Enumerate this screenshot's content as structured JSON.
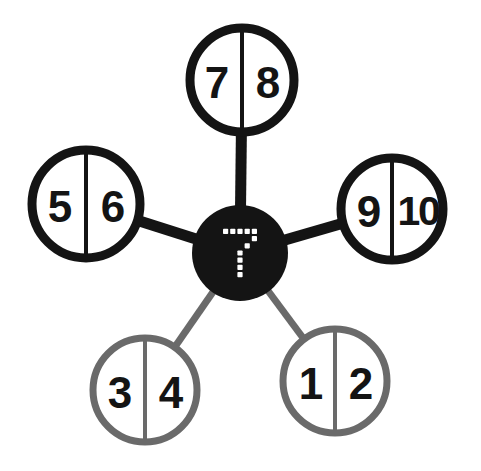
{
  "diagram": {
    "type": "radial-node-graph",
    "background_color": "#ffffff",
    "stroke_color_primary": "#141414",
    "stroke_color_secondary": "#6a6a6a",
    "hub": {
      "label": "7",
      "label_style": "dot-matrix",
      "fill_color": "#141414",
      "label_color": "#ffffff",
      "cx": 240,
      "cy": 253,
      "r": 48
    },
    "nodes": [
      {
        "id": "node-top",
        "position": "top",
        "left_value": "7",
        "right_value": "8",
        "color": "#141414",
        "edge_color": "#141414",
        "edge_width": 11,
        "cx": 242,
        "cy": 80,
        "r": 52,
        "stroke_width": 9
      },
      {
        "id": "node-left",
        "position": "left",
        "left_value": "5",
        "right_value": "6",
        "color": "#141414",
        "edge_color": "#141414",
        "edge_width": 11,
        "cx": 86,
        "cy": 204,
        "r": 54,
        "stroke_width": 9
      },
      {
        "id": "node-right",
        "position": "right",
        "left_value": "9",
        "right_value": "10",
        "color": "#141414",
        "edge_color": "#141414",
        "edge_width": 11,
        "cx": 392,
        "cy": 209,
        "r": 51,
        "stroke_width": 9
      },
      {
        "id": "node-bottom-left",
        "position": "bottom-left",
        "left_value": "3",
        "right_value": "4",
        "color": "#6a6a6a",
        "edge_color": "#6a6a6a",
        "edge_width": 7,
        "cx": 145,
        "cy": 390,
        "r": 52,
        "stroke_width": 7
      },
      {
        "id": "node-bottom-right",
        "position": "bottom-right",
        "left_value": "1",
        "right_value": "2",
        "color": "#6a6a6a",
        "edge_color": "#6a6a6a",
        "edge_width": 7,
        "cx": 335,
        "cy": 381,
        "r": 52,
        "stroke_width": 7
      }
    ]
  }
}
